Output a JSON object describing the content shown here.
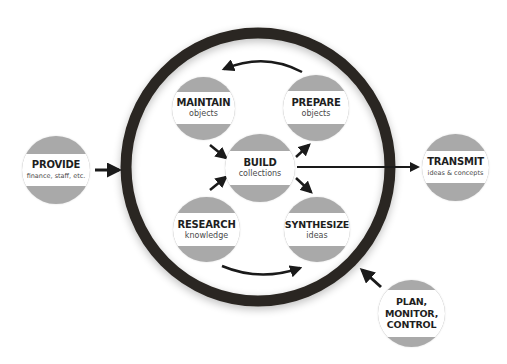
{
  "diagram": {
    "colors": {
      "ring": "#2b2722",
      "node_fill": "#a9a9a9",
      "node_band": "#ffffff",
      "arrow": "#1a1a1a",
      "title_text": "#1e1e1e",
      "sub_text": "#4a4a4a"
    },
    "inner_nodes": {
      "maintain": {
        "title": "MAINTAIN",
        "subtitle": "objects"
      },
      "prepare": {
        "title": "PREPARE",
        "subtitle": "objects"
      },
      "build": {
        "title": "BUILD",
        "subtitle": "collections"
      },
      "research": {
        "title": "RESEARCH",
        "subtitle": "knowledge"
      },
      "synthesize": {
        "title": "SYNTHESIZE",
        "subtitle": "ideas"
      }
    },
    "outer_nodes": {
      "provide": {
        "title": "PROVIDE",
        "subtitle": "finance, staff, etc."
      },
      "transmit": {
        "title": "TRANSMIT",
        "subtitle": "ideas & concepts"
      },
      "plan": {
        "title": "PLAN, MONITOR, CONTROL"
      }
    },
    "edges": [
      {
        "from": "PREPARE",
        "to": "MAINTAIN",
        "style": "curved"
      },
      {
        "from": "MAINTAIN",
        "to": "BUILD"
      },
      {
        "from": "RESEARCH",
        "to": "BUILD"
      },
      {
        "from": "BUILD",
        "to": "PREPARE"
      },
      {
        "from": "BUILD",
        "to": "SYNTHESIZE"
      },
      {
        "from": "RESEARCH",
        "to": "SYNTHESIZE",
        "style": "curved"
      },
      {
        "from": "BUILD",
        "to": "TRANSMIT"
      },
      {
        "from": "PROVIDE",
        "to": "ring"
      },
      {
        "from": "PLAN, MONITOR, CONTROL",
        "to": "ring"
      }
    ]
  }
}
